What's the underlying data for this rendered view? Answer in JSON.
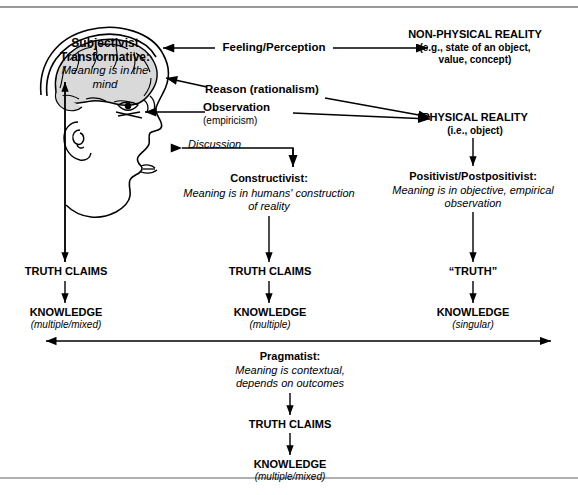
{
  "diagram": {
    "head": {
      "brain_label_line1": "Subjectivist",
      "brain_label_line2": "Transformative:",
      "brain_label_line3": "Meaning is in the",
      "brain_label_line4": "mind"
    },
    "channels": {
      "feeling": "Feeling/Perception",
      "reason": "Reason (rationalism)",
      "observation": "Observation",
      "observation_sub": "(empiricism)",
      "discussion": "Discussion"
    },
    "reality": {
      "nonphysical_title": "NON-PHYSICAL REALITY",
      "nonphysical_sub_line1": "(e.g., state of an object,",
      "nonphysical_sub_line2": "value, concept)",
      "physical_title": "PHYSICAL REALITY",
      "physical_sub": "(i.e., object)"
    },
    "columns": [
      {
        "id": "subjectivist",
        "truth": "TRUTH CLAIMS",
        "knowledge": "KNOWLEDGE",
        "knowledge_sub": "(multiple/mixed)"
      },
      {
        "id": "constructivist",
        "stance_title": "Constructivist:",
        "stance_line1": "Meaning is in humans' construction",
        "stance_line2": "of reality",
        "truth": "TRUTH CLAIMS",
        "knowledge": "KNOWLEDGE",
        "knowledge_sub": "(multiple)"
      },
      {
        "id": "positivist",
        "stance_title": "Positivist/Postpositivist:",
        "stance_line1": "Meaning is in objective, empirical",
        "stance_line2": "observation",
        "truth": "“TRUTH”",
        "knowledge": "KNOWLEDGE",
        "knowledge_sub": "(singular)"
      }
    ],
    "pragmatist": {
      "title": "Pragmatist:",
      "line1": "Meaning is contextual,",
      "line2": "depends on outcomes",
      "truth": "TRUTH CLAIMS",
      "knowledge": "KNOWLEDGE",
      "knowledge_sub": "(multiple/mixed)"
    },
    "colors": {
      "line": "#000000",
      "brain_fill": "#d9d9d9",
      "frame": "#9a9a9a",
      "background": "#ffffff"
    }
  }
}
